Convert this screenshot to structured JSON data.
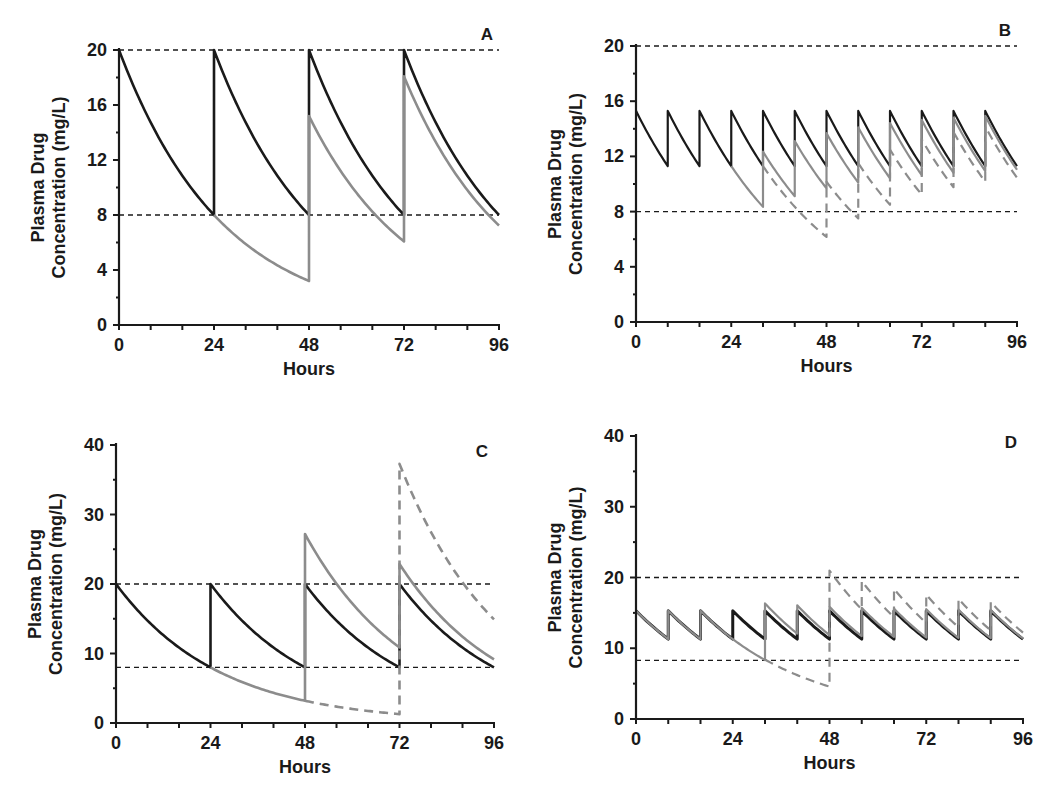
{
  "chart_data": [
    {
      "panel": "A",
      "type": "line",
      "title": "A",
      "xlabel": "Hours",
      "ylabel_line1": "Plasma Drug",
      "ylabel_line2": "Concentration (mg/L)",
      "xlim": [
        0,
        96
      ],
      "ylim": [
        0,
        20
      ],
      "xticks": [
        0,
        24,
        48,
        72,
        96
      ],
      "yticks": [
        0,
        4,
        8,
        12,
        16,
        20
      ],
      "x_minor_step": 8,
      "y_minor_step": 2,
      "grid": false,
      "reference_lines": [
        20,
        8
      ],
      "frame": {
        "x0": 119,
        "x1": 499,
        "y0": 325,
        "y1": 50
      },
      "k": 0.03818,
      "series": [
        {
          "name": "Regular dosing every 24 h",
          "color": "#1a1a1a",
          "style": "solid",
          "width": 2.6,
          "c0": 20,
          "t_end": 96,
          "doses": [
            [
              24,
              12
            ],
            [
              48,
              12
            ],
            [
              72,
              12
            ]
          ],
          "points": [
            [
              0,
              20
            ],
            [
              24,
              8
            ],
            [
              24,
              20
            ],
            [
              48,
              8
            ],
            [
              48,
              20
            ],
            [
              72,
              8
            ],
            [
              72,
              20
            ],
            [
              96,
              8
            ]
          ]
        },
        {
          "name": "Missed dose at 24 h, regular thereafter",
          "color": "#8c8c8c",
          "style": "solid",
          "width": 2.6,
          "c0": 8,
          "t_start": 24,
          "t_end": 96,
          "doses": [
            [
              48,
              12
            ],
            [
              72,
              12
            ]
          ],
          "points": [
            [
              24,
              8
            ],
            [
              48,
              3.3
            ],
            [
              48,
              15.3
            ],
            [
              72,
              6.1
            ],
            [
              72,
              18.1
            ],
            [
              96,
              7.3
            ]
          ]
        }
      ]
    },
    {
      "panel": "B",
      "type": "line",
      "title": "B",
      "xlabel": "Hours",
      "ylabel_line1": "Plasma Drug",
      "ylabel_line2": "Concentration (mg/L)",
      "xlim": [
        0,
        96
      ],
      "ylim": [
        0,
        20
      ],
      "xticks": [
        0,
        24,
        48,
        72,
        96
      ],
      "yticks": [
        0,
        4,
        8,
        12,
        16,
        20
      ],
      "x_minor_step": 8,
      "y_minor_step": 2,
      "grid": false,
      "reference_lines": [
        20,
        8
      ],
      "frame": {
        "x0": 636,
        "x1": 1017,
        "y0": 322,
        "y1": 46
      },
      "k": 0.0379,
      "series": [
        {
          "name": "Regular dosing every 8 h",
          "color": "#1a1a1a",
          "style": "solid",
          "width": 2.2,
          "c0": 15.3,
          "t_end": 96,
          "doses": [
            [
              8,
              4.0
            ],
            [
              16,
              4.0
            ],
            [
              24,
              4.0
            ],
            [
              32,
              4.0
            ],
            [
              40,
              4.0
            ],
            [
              48,
              4.0
            ],
            [
              56,
              4.0
            ],
            [
              64,
              4.0
            ],
            [
              72,
              4.0
            ],
            [
              80,
              4.0
            ],
            [
              88,
              4.0
            ]
          ],
          "points": [
            [
              0,
              15.3
            ],
            [
              8,
              11.3
            ],
            [
              8,
              15.3
            ],
            [
              96,
              11.3
            ]
          ]
        },
        {
          "name": "Missed dose at 24 h",
          "color": "#8c8c8c",
          "style": "solid",
          "width": 2.2,
          "c0": 11.3,
          "t_start": 24,
          "t_end": 96,
          "doses": [
            [
              32,
              4.0
            ],
            [
              40,
              4.0
            ],
            [
              48,
              4.0
            ],
            [
              56,
              4.0
            ],
            [
              64,
              4.0
            ],
            [
              72,
              4.0
            ],
            [
              80,
              4.0
            ],
            [
              88,
              4.0
            ]
          ],
          "points": [
            [
              24,
              11.3
            ],
            [
              32,
              8.4
            ],
            [
              32,
              12.4
            ],
            [
              96,
              11.1
            ]
          ]
        },
        {
          "name": "Missed doses at 24 h and 32 h",
          "color": "#8c8c8c",
          "style": "dashed",
          "width": 2.2,
          "c0": 11.3,
          "t_start": 32,
          "t_end": 96,
          "doses": [
            [
              48,
              4.0
            ],
            [
              56,
              4.0
            ],
            [
              64,
              4.0
            ],
            [
              72,
              4.0
            ],
            [
              80,
              4.0
            ],
            [
              88,
              4.0
            ]
          ],
          "points": [
            [
              32,
              8.4
            ],
            [
              48,
              4.6
            ],
            [
              48,
              8.6
            ],
            [
              56,
              6.6
            ],
            [
              96,
              10.6
            ]
          ]
        }
      ]
    },
    {
      "panel": "C",
      "type": "line",
      "title": "C",
      "xlabel": "Hours",
      "ylabel_line1": "Plasma Drug",
      "ylabel_line2": "Concentration (mg/L)",
      "xlim": [
        0,
        96
      ],
      "ylim": [
        0,
        40
      ],
      "xticks": [
        0,
        24,
        48,
        72,
        96
      ],
      "yticks": [
        0,
        10,
        20,
        30,
        40
      ],
      "x_minor_step": 8,
      "y_minor_step": 5,
      "grid": false,
      "reference_lines": [
        20,
        8
      ],
      "frame": {
        "x0": 116,
        "x1": 494,
        "y0": 723,
        "y1": 445
      },
      "k": 0.03818,
      "series": [
        {
          "name": "Regular dosing every 24 h",
          "color": "#1a1a1a",
          "style": "solid",
          "width": 2.6,
          "c0": 20,
          "t_end": 96,
          "doses": [
            [
              24,
              12
            ],
            [
              48,
              12
            ],
            [
              72,
              12
            ]
          ],
          "points": [
            [
              0,
              20
            ],
            [
              24,
              8
            ],
            [
              24,
              20
            ],
            [
              96,
              8
            ]
          ]
        },
        {
          "name": "Missed dose at 24 h, double dose at 48 h",
          "color": "#8c8c8c",
          "style": "solid",
          "width": 2.6,
          "c0": 8,
          "t_start": 24,
          "t_end": 96,
          "doses": [
            [
              48,
              24
            ],
            [
              72,
              12
            ]
          ],
          "points": [
            [
              24,
              8
            ],
            [
              48,
              3.2
            ],
            [
              48,
              27.2
            ],
            [
              72,
              10.9
            ],
            [
              72,
              22.9
            ],
            [
              96,
              9.2
            ]
          ]
        },
        {
          "name": "Missed doses at 24 h and 48 h, triple dose at 72 h",
          "color": "#8c8c8c",
          "style": "dashed",
          "width": 2.6,
          "c0": 3.2,
          "t_start": 48,
          "t_end": 96,
          "doses": [
            [
              72,
              36
            ]
          ],
          "points": [
            [
              48,
              3.2
            ],
            [
              72,
              1.3
            ],
            [
              72,
              37.3
            ],
            [
              96,
              14.9
            ]
          ]
        }
      ]
    },
    {
      "panel": "D",
      "type": "line",
      "title": "D",
      "xlabel": "Hours",
      "ylabel_line1": "Plasma Drug",
      "ylabel_line2": "Concentration (mg/L)",
      "xlim": [
        0,
        96
      ],
      "ylim": [
        0,
        40
      ],
      "xticks": [
        0,
        24,
        48,
        72,
        96
      ],
      "yticks": [
        0,
        10,
        20,
        30,
        40
      ],
      "x_minor_step": 8,
      "y_minor_step": 5,
      "grid": false,
      "reference_lines": [
        20,
        8.3
      ],
      "frame": {
        "x0": 636,
        "x1": 1023,
        "y0": 719,
        "y1": 436
      },
      "k": 0.0379,
      "series": [
        {
          "name": "Regular dosing every 8 h",
          "color": "#1a1a1a",
          "style": "solid",
          "width": 3.0,
          "c0": 15.3,
          "t_end": 96,
          "doses": [
            [
              8,
              4.0
            ],
            [
              16,
              4.0
            ],
            [
              24,
              4.0
            ],
            [
              32,
              4.0
            ],
            [
              40,
              4.0
            ],
            [
              48,
              4.0
            ],
            [
              56,
              4.0
            ],
            [
              64,
              4.0
            ],
            [
              72,
              4.0
            ],
            [
              80,
              4.0
            ],
            [
              88,
              4.0
            ]
          ],
          "points": [
            [
              0,
              15.3
            ],
            [
              8,
              11.3
            ],
            [
              8,
              15.3
            ],
            [
              96,
              11.3
            ]
          ]
        },
        {
          "name": "Missed dose at 24 h, double dose at 32 h",
          "color": "#8c8c8c",
          "style": "solid",
          "width": 2.2,
          "c0": 15.3,
          "t_end": 96,
          "doses": [
            [
              8,
              4.0
            ],
            [
              16,
              4.0
            ],
            [
              32,
              8.0
            ],
            [
              40,
              4.0
            ],
            [
              48,
              4.0
            ],
            [
              56,
              4.0
            ],
            [
              64,
              4.0
            ],
            [
              72,
              4.0
            ],
            [
              80,
              4.0
            ],
            [
              88,
              4.0
            ]
          ],
          "points": [
            [
              0,
              15.3
            ],
            [
              24,
              11.3
            ],
            [
              32,
              8.4
            ],
            [
              32,
              16.4
            ],
            [
              96,
              11.5
            ]
          ]
        },
        {
          "name": "Missed doses at 24 h and 32 h, extra dose at 48 h",
          "color": "#8c8c8c",
          "style": "dashed",
          "width": 2.2,
          "c0": 8.4,
          "t_start": 32,
          "t_end": 96,
          "doses": [
            [
              48,
              16.4
            ],
            [
              56,
              4.0
            ],
            [
              64,
              4.0
            ],
            [
              72,
              4.0
            ],
            [
              80,
              4.0
            ],
            [
              88,
              4.0
            ]
          ],
          "points": [
            [
              32,
              8.4
            ],
            [
              48,
              4.6
            ],
            [
              48,
              21.0
            ],
            [
              56,
              15.5
            ],
            [
              56,
              19.5
            ],
            [
              96,
              12.5
            ]
          ]
        }
      ]
    }
  ]
}
